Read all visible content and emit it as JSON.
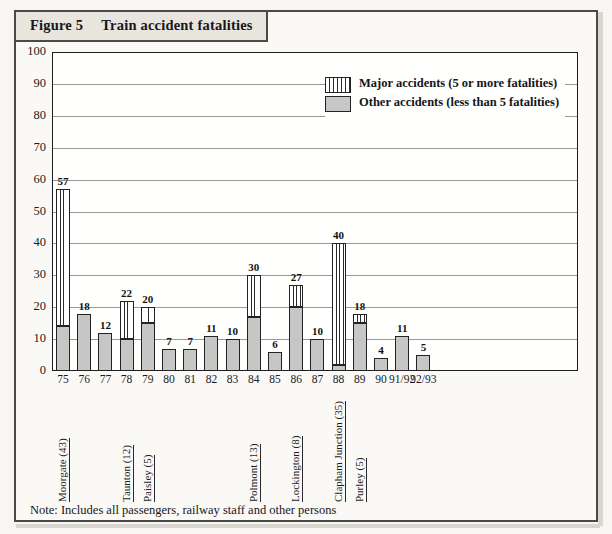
{
  "figure": {
    "label": "Figure 5",
    "title": "Train accident fatalities"
  },
  "note": "Note: Includes all passengers, railway staff and other persons",
  "legend": {
    "items": [
      {
        "key": "striped",
        "label": "Major accidents (5 or more fatalities)"
      },
      {
        "key": "solid",
        "label": "Other accidents (less than 5 fatalities)"
      }
    ]
  },
  "colors": {
    "other_accidents_fill": "#c6c6c4",
    "major_accidents_fill": "#ffffff",
    "outline": "#232325",
    "panel_background": "#faf9f6",
    "header_background": "#e7e5de",
    "gridline": "#9a9a98"
  },
  "chart_data": {
    "type": "bar",
    "title": "Train accident fatalities",
    "subtitle": "",
    "xlabel": "",
    "ylabel": "",
    "ylim": [
      0,
      100
    ],
    "yticks": [
      0,
      10,
      20,
      30,
      40,
      50,
      60,
      70,
      80,
      90,
      100
    ],
    "grid": true,
    "stacked": true,
    "legend_position": "top-right",
    "categories": [
      "75",
      "76",
      "77",
      "78",
      "79",
      "80",
      "81",
      "82",
      "83",
      "84",
      "85",
      "86",
      "87",
      "88",
      "89",
      "90",
      "91/92",
      "92/93"
    ],
    "totals": [
      57,
      18,
      12,
      22,
      20,
      7,
      7,
      11,
      10,
      30,
      6,
      27,
      10,
      40,
      18,
      4,
      11,
      5
    ],
    "series": [
      {
        "name": "Other accidents (less than 5 fatalities)",
        "values": [
          14,
          18,
          12,
          10,
          15,
          7,
          7,
          11,
          10,
          17,
          6,
          20,
          10,
          2,
          15,
          4,
          11,
          5
        ]
      },
      {
        "name": "Major accidents (5 or more fatalities)",
        "values": [
          43,
          0,
          0,
          12,
          5,
          0,
          0,
          0,
          0,
          13,
          0,
          7,
          0,
          38,
          3,
          0,
          0,
          0
        ]
      }
    ],
    "annotations": [
      {
        "category": "75",
        "text": "Moorgate (43)"
      },
      {
        "category": "78",
        "text": "Taunton (12)"
      },
      {
        "category": "79",
        "text": "Paisley (5)"
      },
      {
        "category": "84",
        "text": "Polmont (13)"
      },
      {
        "category": "86",
        "text": "Lockington (8)"
      },
      {
        "category": "88",
        "text": "Clapham Junction (35)"
      },
      {
        "category": "89",
        "text": "Purley (5)"
      }
    ]
  }
}
